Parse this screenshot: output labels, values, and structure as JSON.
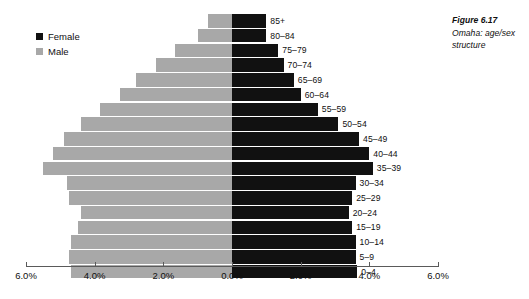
{
  "caption": {
    "title": "Figure 6.17",
    "text": "Omaha: age/sex structure"
  },
  "legend": {
    "items": [
      {
        "label": "Female",
        "color": "#111111",
        "swatch": "female-swatch"
      },
      {
        "label": "Male",
        "color": "#a8a8a8",
        "swatch": "male-swatch"
      }
    ]
  },
  "axis": {
    "ticks": [
      {
        "label": "6.0%",
        "value": -6.0
      },
      {
        "label": "4.0%",
        "value": -4.0
      },
      {
        "label": "2.0%",
        "value": -2.0
      },
      {
        "label": "0.0%",
        "value": 0.0
      },
      {
        "label": "2.0%",
        "value": 2.0
      },
      {
        "label": "4.0%",
        "value": 4.0
      },
      {
        "label": "6.0%",
        "value": 6.0
      }
    ],
    "min": -6.0,
    "max": 6.0
  },
  "chart_data": {
    "type": "bar",
    "subtype": "population-pyramid",
    "title": "Omaha: age/sex structure",
    "xlabel": "",
    "ylabel": "",
    "xlim": [
      -6.0,
      6.0
    ],
    "grid": false,
    "legend_position": "top-left",
    "categories": [
      "85+",
      "80–84",
      "75–79",
      "70–74",
      "65–69",
      "60–64",
      "55–59",
      "50–54",
      "45–49",
      "40–44",
      "35–39",
      "30–34",
      "25–29",
      "20–24",
      "15–19",
      "10–14",
      "5–9",
      "0–4"
    ],
    "series": [
      {
        "name": "Male",
        "color": "#a8a8a8",
        "side": "left",
        "values": [
          0.7,
          1.0,
          1.65,
          2.2,
          2.8,
          3.25,
          3.85,
          4.4,
          4.9,
          5.2,
          5.5,
          4.8,
          4.75,
          4.4,
          4.5,
          4.7,
          4.75,
          4.7
        ]
      },
      {
        "name": "Female",
        "color": "#111111",
        "side": "right",
        "values": [
          1.0,
          1.0,
          1.35,
          1.5,
          1.8,
          2.0,
          2.5,
          3.1,
          3.7,
          4.0,
          4.1,
          3.6,
          3.5,
          3.4,
          3.5,
          3.6,
          3.6,
          3.65
        ]
      }
    ]
  }
}
